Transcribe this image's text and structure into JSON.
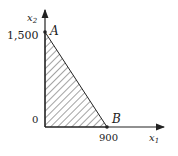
{
  "diagram": {
    "type": "feasible-region",
    "axes": {
      "x": {
        "label": "x",
        "subscript": "1"
      },
      "y": {
        "label": "x",
        "subscript": "2"
      }
    },
    "origin_label": "0",
    "points": [
      {
        "name": "A",
        "coord": [
          0,
          1500
        ],
        "tick_label": "1,500"
      },
      {
        "name": "B",
        "coord": [
          900,
          0
        ],
        "tick_label": "900"
      }
    ],
    "region": "hatched triangle bounded by axes and segment AB"
  }
}
